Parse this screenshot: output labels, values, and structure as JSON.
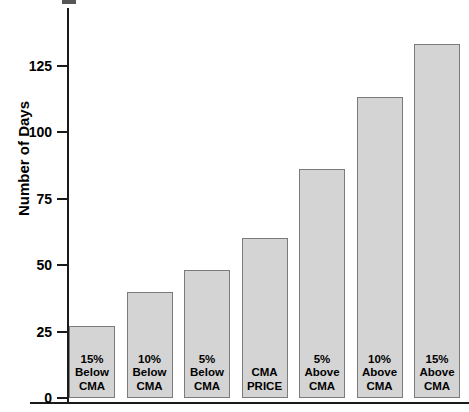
{
  "chart_data": {
    "type": "bar",
    "title": "",
    "xlabel": "",
    "ylabel": "Number of Days",
    "ylim": [
      0,
      140
    ],
    "yticks": [
      0,
      25,
      50,
      75,
      100,
      125
    ],
    "ytick_labels": [
      "0",
      "25",
      "50",
      "75",
      "100",
      "125"
    ],
    "grid": false,
    "legend": "none",
    "bar_color": "#d4d4d4",
    "bar_border_color": "#7b7b7b",
    "axis_color": "#1a1a1a",
    "categories": [
      "15% Below CMA",
      "10% Below CMA",
      "5% Below CMA",
      "CMA PRICE",
      "5% Above CMA",
      "10% Above CMA",
      "15% Above CMA"
    ],
    "category_lines": [
      [
        "15%",
        "Below",
        "CMA"
      ],
      [
        "10%",
        "Below",
        "CMA"
      ],
      [
        "5%",
        "Below",
        "CMA"
      ],
      [
        "CMA",
        "PRICE"
      ],
      [
        "5%",
        "Above",
        "CMA"
      ],
      [
        "10%",
        "Above",
        "CMA"
      ],
      [
        "15%",
        "Above",
        "CMA"
      ]
    ],
    "values": [
      27,
      40,
      48,
      60,
      86,
      113,
      133
    ]
  }
}
